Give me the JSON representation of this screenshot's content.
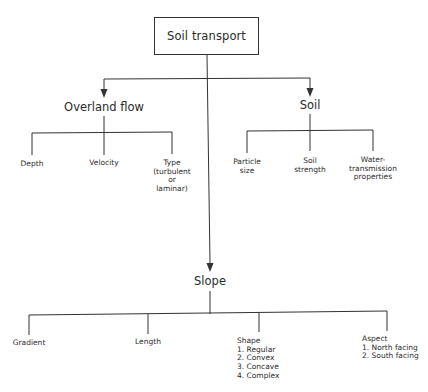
{
  "diagram": {
    "root": {
      "label": "Soil transport"
    },
    "branches": [
      {
        "label": "Overland flow",
        "children": [
          {
            "label": "Depth"
          },
          {
            "label": "Velocity"
          },
          {
            "label": "Type\n(turbulent\nor\nlaminar)"
          }
        ]
      },
      {
        "label": "Soil",
        "children": [
          {
            "label": "Particle\nsize"
          },
          {
            "label": "Soil\nstrength"
          },
          {
            "label": "Water-\ntransmission\nproperties"
          }
        ]
      },
      {
        "label": "Slope",
        "children": [
          {
            "label": "Gradient"
          },
          {
            "label": "Length"
          },
          {
            "label": "Shape\n1. Regular\n2. Convex\n3. Concave\n4. Complex"
          },
          {
            "label": "Aspect\n1. North facing\n2. South facing"
          }
        ]
      }
    ],
    "colors": {
      "line": "#333333",
      "text": "#2a2a2a",
      "background": "#ffffff"
    }
  }
}
